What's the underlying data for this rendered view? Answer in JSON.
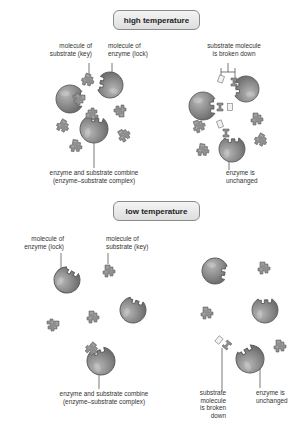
{
  "colors": {
    "enzyme_fill": "#8c8c8c",
    "enzyme_stroke": "#5a5a5a",
    "substrate_fill": "#8f8f8f",
    "fragment_fill": "#f2f2f2",
    "leader_line": "#555555",
    "text": "#333333"
  },
  "sections": [
    {
      "id": "high",
      "header": {
        "label": "high temperature",
        "x": 113,
        "y": 10,
        "w": 87
      },
      "labels": [
        {
          "id": "substrate-key",
          "text": "molecule of\nsubstrate (key)",
          "x": 36,
          "y": 42,
          "w": 56,
          "align": "r"
        },
        {
          "id": "enzyme-lock",
          "text": "molecule of\nenzyme (lock)",
          "x": 108,
          "y": 42,
          "w": 56,
          "align": "l"
        },
        {
          "id": "broken-down",
          "text": "substrate molecule\nis broken down",
          "x": 190,
          "y": 42,
          "w": 88,
          "align": "c"
        },
        {
          "id": "complex",
          "text": "enzyme and substrate combine\n(enzyme–substrate complex)",
          "x": 30,
          "y": 169,
          "w": 128,
          "align": "c"
        },
        {
          "id": "unchanged",
          "text": "enzyme is\nunchanged",
          "x": 226,
          "y": 169,
          "w": 50,
          "align": "l"
        }
      ]
    },
    {
      "id": "low",
      "header": {
        "label": "low temperature",
        "x": 113,
        "y": 201,
        "w": 87
      },
      "labels": [
        {
          "id": "enzyme-lock",
          "text": "molecule of\nenzyme (lock)",
          "x": 6,
          "y": 235,
          "w": 58,
          "align": "r"
        },
        {
          "id": "substrate-key",
          "text": "molecule of\nsubstrate (key)",
          "x": 106,
          "y": 235,
          "w": 60,
          "align": "l"
        },
        {
          "id": "complex",
          "text": "enzyme and substrate combine\n(enzyme–substrate complex)",
          "x": 40,
          "y": 390,
          "w": 128,
          "align": "c"
        },
        {
          "id": "broken-down",
          "text": "substrate\nmolecule\nis broken\ndown",
          "x": 184,
          "y": 389,
          "w": 42,
          "align": "r"
        },
        {
          "id": "unchanged",
          "text": "enzyme is\nunchanged",
          "x": 256,
          "y": 389,
          "w": 46,
          "align": "l"
        }
      ]
    }
  ],
  "enzymes": [
    {
      "section": "high",
      "cx": 110,
      "cy": 85,
      "r": 13,
      "rot": 190
    },
    {
      "section": "high",
      "cx": 70,
      "cy": 99,
      "r": 14,
      "rot": 0
    },
    {
      "section": "high",
      "cx": 94,
      "cy": 129,
      "r": 14,
      "rot": -80
    },
    {
      "section": "high",
      "cx": 246,
      "cy": 89,
      "r": 13,
      "rot": 180
    },
    {
      "section": "high",
      "cx": 203,
      "cy": 106,
      "r": 14,
      "rot": 0
    },
    {
      "section": "high",
      "cx": 232,
      "cy": 149,
      "r": 13,
      "rot": -90
    },
    {
      "section": "low",
      "cx": 67,
      "cy": 280,
      "r": 13,
      "rot": -60
    },
    {
      "section": "low",
      "cx": 133,
      "cy": 310,
      "r": 13,
      "rot": -70
    },
    {
      "section": "low",
      "cx": 101,
      "cy": 361,
      "r": 14,
      "rot": -110
    },
    {
      "section": "low",
      "cx": 215,
      "cy": 271,
      "r": 13,
      "rot": 10
    },
    {
      "section": "low",
      "cx": 265,
      "cy": 310,
      "r": 13,
      "rot": -90
    },
    {
      "section": "low",
      "cx": 250,
      "cy": 359,
      "r": 14,
      "rot": -120
    }
  ],
  "substrates": [
    {
      "section": "high",
      "x": 88,
      "y": 80,
      "rot": 20
    },
    {
      "section": "high",
      "x": 79,
      "y": 99,
      "rot": 90,
      "bound": true
    },
    {
      "section": "high",
      "x": 92,
      "y": 114,
      "rot": -90,
      "bound": true
    },
    {
      "section": "high",
      "x": 120,
      "y": 111,
      "rot": 180
    },
    {
      "section": "high",
      "x": 63,
      "y": 126,
      "rot": 30
    },
    {
      "section": "high",
      "x": 124,
      "y": 135,
      "rot": -30
    },
    {
      "section": "high",
      "x": 76,
      "y": 146,
      "rot": 10
    },
    {
      "section": "high",
      "x": 257,
      "y": 119,
      "rot": 0
    },
    {
      "section": "high",
      "x": 199,
      "y": 126,
      "rot": -20
    },
    {
      "section": "high",
      "x": 261,
      "y": 140,
      "rot": 30
    },
    {
      "section": "high",
      "x": 203,
      "y": 150,
      "rot": 10
    },
    {
      "section": "low",
      "x": 109,
      "y": 271,
      "rot": 0
    },
    {
      "section": "low",
      "x": 93,
      "y": 317,
      "rot": 0
    },
    {
      "section": "low",
      "x": 53,
      "y": 325,
      "rot": 90
    },
    {
      "section": "low",
      "x": 92,
      "y": 349,
      "rot": 40,
      "bound": true
    },
    {
      "section": "low",
      "x": 264,
      "y": 268,
      "rot": 0
    },
    {
      "section": "low",
      "x": 207,
      "y": 313,
      "rot": 0
    },
    {
      "section": "low",
      "x": 280,
      "y": 346,
      "rot": 0
    }
  ],
  "fragments": [
    {
      "section": "high",
      "x": 221,
      "y": 79,
      "rot": 20,
      "kind": "half"
    },
    {
      "section": "high",
      "x": 234,
      "y": 82,
      "rot": 0,
      "kind": "gray-half"
    },
    {
      "section": "high",
      "x": 220,
      "y": 107,
      "rot": 0,
      "kind": "gray-half"
    },
    {
      "section": "high",
      "x": 230,
      "y": 107,
      "rot": 0,
      "kind": "half"
    },
    {
      "section": "high",
      "x": 220,
      "y": 124,
      "rot": -20,
      "kind": "half"
    },
    {
      "section": "high",
      "x": 226,
      "y": 133,
      "rot": 0,
      "kind": "gray-half"
    },
    {
      "section": "low",
      "x": 219,
      "y": 340,
      "rot": 40,
      "kind": "half"
    },
    {
      "section": "low",
      "x": 227,
      "y": 345,
      "rot": 40,
      "kind": "gray-half"
    }
  ],
  "leaders": [
    {
      "d": "M 89 63 L 89 76"
    },
    {
      "d": "M 112 63 L 112 80"
    },
    {
      "d": "M 94 132 L 94 168"
    },
    {
      "d": "M 221 68 L 221 72 L 235 72 L 235 68 M 228 63 L 228 72 M 221 72 L 221 77 M 235 72 L 235 79"
    },
    {
      "d": "M 229 152 L 229 170"
    },
    {
      "d": "M 61 253 L 61 268"
    },
    {
      "d": "M 108 253 L 108 264"
    },
    {
      "d": "M 99 364 L 99 389"
    },
    {
      "d": "M 222 348 L 222 391"
    },
    {
      "d": "M 258 360 L 260 360 L 260 388"
    }
  ]
}
